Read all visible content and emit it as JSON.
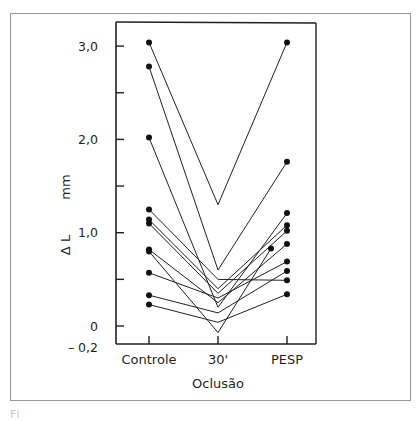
{
  "chart_data": {
    "type": "line",
    "title": "",
    "xlabel": "Oclusão",
    "ylabel": "Δ L",
    "yunit": "mm",
    "categories": [
      "Controle",
      "30'",
      "PESP"
    ],
    "ylim": [
      -0.2,
      3.2
    ],
    "yticks": [
      {
        "value": 3.0,
        "label": "3,0"
      },
      {
        "value": 2.5,
        "label": ""
      },
      {
        "value": 2.0,
        "label": "2,0"
      },
      {
        "value": 1.5,
        "label": ""
      },
      {
        "value": 1.0,
        "label": "1,0"
      },
      {
        "value": 0.5,
        "label": ""
      },
      {
        "value": 0.0,
        "label": "0"
      }
    ],
    "ymin_label": "– 0,2",
    "grid": false,
    "legend": null,
    "series": [
      {
        "name": "S1",
        "values": [
          3.04,
          1.3,
          3.04
        ]
      },
      {
        "name": "S2",
        "values": [
          2.78,
          0.6,
          1.76
        ]
      },
      {
        "name": "S3",
        "values": [
          2.02,
          0.2,
          1.21
        ]
      },
      {
        "name": "S4",
        "values": [
          1.25,
          0.5,
          0.49
        ]
      },
      {
        "name": "S5",
        "values": [
          1.14,
          0.4,
          1.08
        ]
      },
      {
        "name": "S6",
        "values": [
          1.1,
          0.35,
          1.02
        ]
      },
      {
        "name": "S7",
        "values": [
          0.82,
          0.25,
          0.88
        ]
      },
      {
        "name": "S8",
        "values": [
          0.8,
          -0.07,
          0.83
        ]
      },
      {
        "name": "S9",
        "values": [
          0.57,
          0.3,
          0.69
        ]
      },
      {
        "name": "S10",
        "values": [
          0.33,
          0.14,
          0.59
        ]
      },
      {
        "name": "S11",
        "values": [
          0.23,
          0.04,
          0.34
        ]
      }
    ]
  },
  "caption_fragment": "Fi                             "
}
